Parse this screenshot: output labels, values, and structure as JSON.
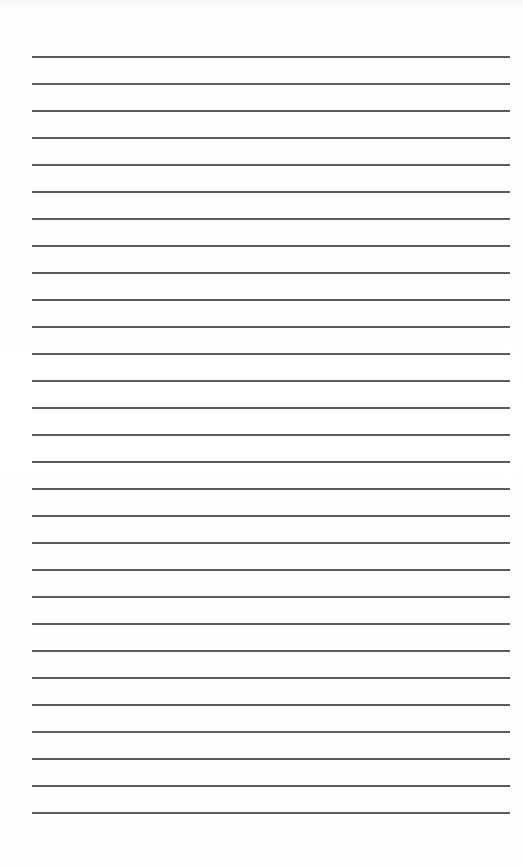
{
  "page": {
    "type": "lined-paper",
    "background_color": "#ffffff",
    "line_color": "#4a4a4a",
    "line_count": 29,
    "first_line_y": 56,
    "line_spacing": 27,
    "line_left": 32,
    "line_right": 510
  }
}
